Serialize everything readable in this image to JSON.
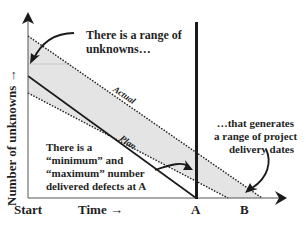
{
  "diagram": {
    "y_axis_label": "Number of unknowns →",
    "x_axis_start_label": "Start",
    "x_axis_time_label": "Time →",
    "marker_a_label": "A",
    "marker_b_label": "B",
    "line_labels": {
      "actual": "Actual",
      "plan": "Plan"
    },
    "annotations": {
      "range_of_unknowns": [
        "There is a range of",
        "unknowns…"
      ],
      "min_max_defects": [
        "There is a",
        "“minimum” and",
        "“maximum”  number",
        "delivered defects at A"
      ],
      "delivery_dates": [
        "…that generates",
        "a range of project",
        "delivery dates"
      ]
    },
    "colors": {
      "band_fill": "#e4e4e4",
      "line": "#1a1a1a",
      "axis": "#555555"
    }
  }
}
